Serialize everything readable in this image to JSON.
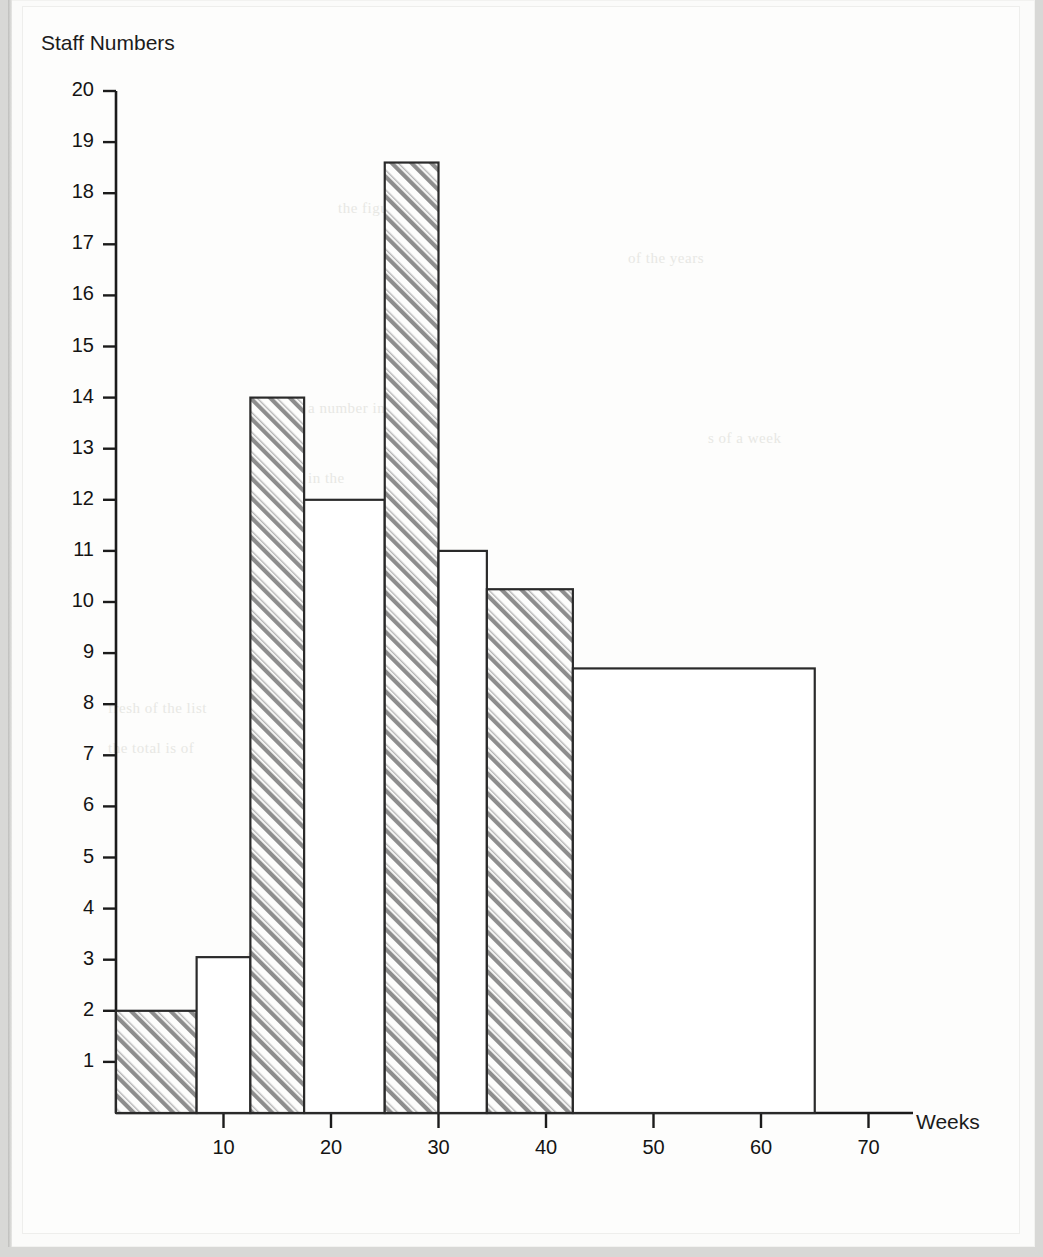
{
  "document": {
    "kind": "scanned-textbook-page",
    "background_color": "#d8d8d6",
    "paper_color": "#fdfdfc"
  },
  "chart_data": {
    "type": "bar",
    "title": "",
    "subtitle": "",
    "xlabel": "Weeks",
    "ylabel": "Staff Numbers",
    "xlim": [
      0,
      75
    ],
    "ylim": [
      0,
      20
    ],
    "grid": false,
    "legend": null,
    "annotations": [],
    "xticks": [
      10,
      20,
      30,
      40,
      50,
      60,
      70
    ],
    "xtick_labels": [
      "10",
      "20",
      "30",
      "40",
      "50",
      "60",
      "70"
    ],
    "yticks": [
      1,
      2,
      3,
      4,
      5,
      6,
      7,
      8,
      9,
      10,
      11,
      12,
      13,
      14,
      15,
      16,
      17,
      18,
      19,
      20
    ],
    "ytick_labels": [
      "1",
      "2",
      "3",
      "4",
      "5",
      "6",
      "7",
      "8",
      "9",
      "10",
      "11",
      "12",
      "13",
      "14",
      "15",
      "16",
      "17",
      "18",
      "19",
      "20"
    ],
    "style": {
      "bar_edge_color": "#2a2a2a",
      "bar_fill_hatched": "#8a8a8a",
      "bar_fill_plain": "#ffffff",
      "axis_color": "#1b1b1b"
    },
    "bins": [
      {
        "label": "0-7.5",
        "x_start": 0,
        "x_end": 7.5,
        "value": 2,
        "hatched": true
      },
      {
        "label": "7.5-12.5",
        "x_start": 7.5,
        "x_end": 12.5,
        "value": 3.05,
        "hatched": false
      },
      {
        "label": "12.5-17.5",
        "x_start": 12.5,
        "x_end": 17.5,
        "value": 14,
        "hatched": true
      },
      {
        "label": "17.5-25",
        "x_start": 17.5,
        "x_end": 25,
        "value": 12,
        "hatched": false
      },
      {
        "label": "25-30",
        "x_start": 25,
        "x_end": 30,
        "value": 18.6,
        "hatched": true
      },
      {
        "label": "30-34.5",
        "x_start": 30,
        "x_end": 34.5,
        "value": 11,
        "hatched": false
      },
      {
        "label": "34.5-42.5",
        "x_start": 34.5,
        "x_end": 42.5,
        "value": 10.25,
        "hatched": true
      },
      {
        "label": "42.5-65",
        "x_start": 42.5,
        "x_end": 65,
        "value": 8.7,
        "hatched": false
      }
    ]
  },
  "ghost_text": [
    {
      "text": "the figures in",
      "x": 330,
      "y": 200
    },
    {
      "text": "of the years",
      "x": 620,
      "y": 250
    },
    {
      "text": "a number in",
      "x": 300,
      "y": 400
    },
    {
      "text": "s of a week",
      "x": 700,
      "y": 430
    },
    {
      "text": "in the",
      "x": 300,
      "y": 470
    },
    {
      "text": "fresh of  the list",
      "x": 100,
      "y": 700
    },
    {
      "text": "the total is of",
      "x": 100,
      "y": 740
    },
    {
      "text": "of the period",
      "x": 230,
      "y": 950
    },
    {
      "text": "number of weeks",
      "x": 330,
      "y": 1010
    }
  ]
}
